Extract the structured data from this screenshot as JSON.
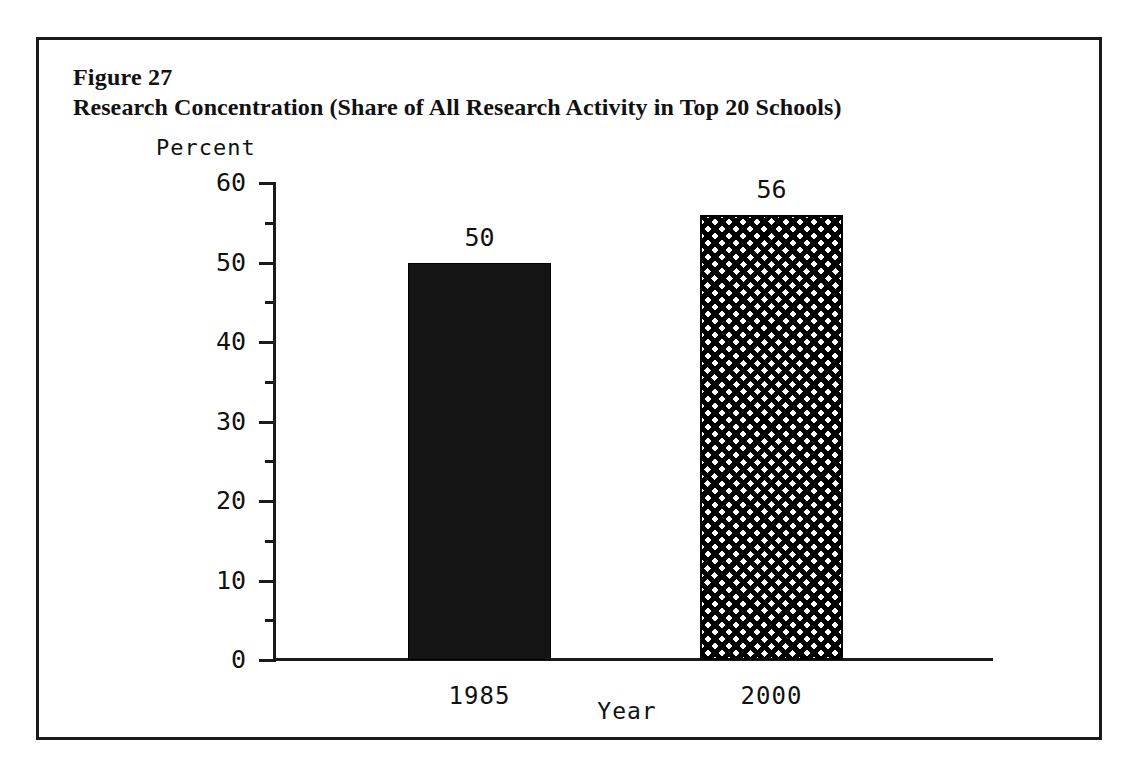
{
  "figure": {
    "number_label": "Figure 27",
    "title": "Research Concentration (Share of All Research Activity in Top 20 Schools)"
  },
  "chart_data": {
    "type": "bar",
    "title": "Research Concentration (Share of All Research Activity in Top 20 Schools)",
    "categories": [
      "1985",
      "2000"
    ],
    "values": [
      50,
      56
    ],
    "value_labels": [
      "50",
      "56"
    ],
    "xlabel": "Year",
    "ylabel": "Percent",
    "ylim": [
      0,
      60
    ],
    "yticks": [
      60,
      50,
      40,
      30,
      20,
      10,
      0
    ],
    "ytick_labels": [
      "60",
      "50",
      "40",
      "30",
      "20",
      "10",
      "0"
    ],
    "minor_ytick_interval": 5,
    "grid": false,
    "legend": null,
    "series_styles": [
      "solid-black-fill",
      "crosshatch-pattern"
    ],
    "colors": {
      "bar_1985": "#141414",
      "bar_2000_lines": "#000000",
      "bar_2000_background": "#ffffff",
      "axis": "#1a1a1a",
      "frame": "#1a1a1a",
      "text": "#111111",
      "page_background": "#ffffff"
    }
  }
}
